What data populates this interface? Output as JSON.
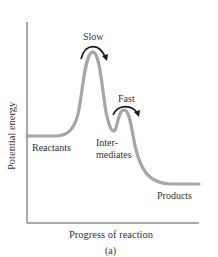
{
  "figure": {
    "y_axis_label": "Potential energy",
    "x_axis_label": "Progress of reaction",
    "caption": "(a)",
    "labels": {
      "slow": "Slow",
      "fast": "Fast",
      "reactants": "Reactants",
      "intermediates_line1": "Inter-",
      "intermediates_line2": "mediates",
      "products": "Products"
    },
    "colors": {
      "curve": "#a6a6a6",
      "axes": "#555555",
      "arrows": "#1a1a1a",
      "text": "#333333"
    }
  }
}
